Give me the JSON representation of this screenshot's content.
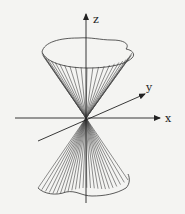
{
  "figure": {
    "background": "#f4f4f2",
    "stroke_color": "#333333",
    "axes": {
      "x": {
        "label": "x"
      },
      "y": {
        "label": "y"
      },
      "z": {
        "label": "z"
      }
    },
    "surface": {
      "type": "double-cone",
      "upper_nappe_rulings": 24,
      "lower_nappe_rulings": 24
    }
  }
}
